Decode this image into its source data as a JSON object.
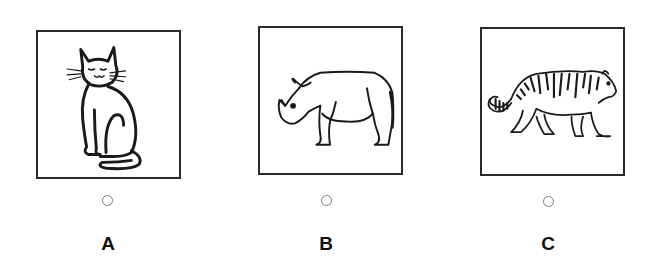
{
  "question": {
    "options": [
      {
        "letter": "A",
        "image": "cat-drawing",
        "selected": false
      },
      {
        "letter": "B",
        "image": "rhinoceros-drawing",
        "selected": false
      },
      {
        "letter": "C",
        "image": "tiger-drawing",
        "selected": false
      }
    ]
  },
  "colors": {
    "border": "#2a2a2a",
    "line_art": "#1a1a1a",
    "radio_border": "#7a7a7a",
    "letter": "#111111",
    "background": "#ffffff"
  }
}
